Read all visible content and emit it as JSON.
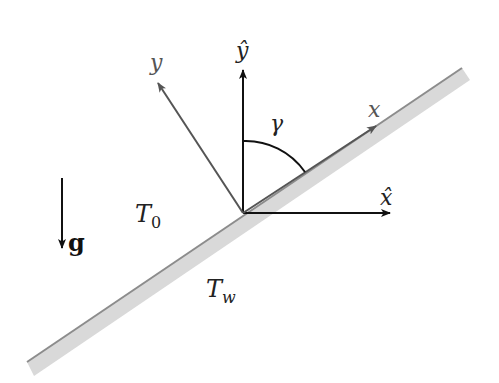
{
  "diagram": {
    "colors": {
      "plate_fill": "#d9d9d9",
      "plate_edge": "#8c8c8c",
      "axis_dark": "#111111",
      "axis_grey": "#555555",
      "background": "#ffffff"
    },
    "labels": {
      "y_hat": "ŷ",
      "x_hat": "x̂",
      "y": "y",
      "x": "x",
      "gamma": "γ",
      "T0_main": "T",
      "T0_sub": "0",
      "Tw_main": "T",
      "Tw_sub": "w",
      "gravity": "g"
    },
    "elements": [
      {
        "id": "plate",
        "type": "inclined-wall"
      },
      {
        "id": "y-hat-axis",
        "label": "ŷ",
        "direction": "vertical-up"
      },
      {
        "id": "x-hat-axis",
        "label": "x̂",
        "direction": "horizontal-right"
      },
      {
        "id": "y-axis",
        "label": "y",
        "direction": "normal-to-plate"
      },
      {
        "id": "x-axis",
        "label": "x",
        "direction": "along-plate"
      },
      {
        "id": "angle-arc",
        "label": "γ",
        "between": [
          "ŷ",
          "x"
        ]
      },
      {
        "id": "fluid-temperature",
        "label": "T0"
      },
      {
        "id": "wall-temperature",
        "label": "Tw"
      },
      {
        "id": "gravity-vector",
        "label": "g",
        "direction": "down"
      }
    ]
  }
}
